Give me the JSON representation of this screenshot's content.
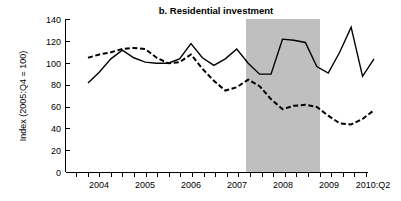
{
  "chart_data": {
    "type": "line",
    "title": "b. Residential investment",
    "xlabel": "",
    "ylabel": "Index (2005:Q4 = 100)",
    "ylim": [
      0,
      140
    ],
    "yticks": [
      0,
      20,
      40,
      60,
      80,
      100,
      120,
      140
    ],
    "ytick_labels": [
      "0",
      "20",
      "40",
      "60",
      "80",
      "100",
      "120",
      "140"
    ],
    "xlim": [
      "2004:Q1",
      "2010:Q2"
    ],
    "xtick_labels": [
      "2004",
      "2005",
      "2006",
      "2007",
      "2008",
      "2009",
      "2010:Q2"
    ],
    "grid": false,
    "legend": "none",
    "x": [
      "2004:Q1",
      "2004:Q2",
      "2004:Q3",
      "2004:Q4",
      "2005:Q1",
      "2005:Q2",
      "2005:Q3",
      "2005:Q4",
      "2006:Q1",
      "2006:Q2",
      "2006:Q3",
      "2006:Q4",
      "2007:Q1",
      "2007:Q2",
      "2007:Q3",
      "2007:Q4",
      "2008:Q1",
      "2008:Q2",
      "2008:Q3",
      "2008:Q4",
      "2009:Q1",
      "2009:Q2",
      "2009:Q3",
      "2009:Q4",
      "2010:Q1",
      "2010:Q2"
    ],
    "series": [
      {
        "name": "solid-series",
        "style": "solid",
        "color": "#000000",
        "values": [
          82,
          92,
          104,
          112,
          105,
          101,
          100,
          100,
          104,
          118,
          105,
          98,
          104,
          113,
          100,
          90,
          90,
          122,
          121,
          119,
          97,
          91,
          110,
          133,
          88,
          104
        ]
      },
      {
        "name": "dashed-series",
        "style": "dashed",
        "color": "#000000",
        "values": [
          105,
          108,
          110,
          113,
          114,
          113,
          105,
          100,
          101,
          108,
          95,
          84,
          75,
          78,
          85,
          79,
          67,
          58,
          61,
          62,
          60,
          52,
          45,
          44,
          49,
          57
        ]
      }
    ],
    "shaded_regions": [
      {
        "name": "recession-band",
        "label": "recession",
        "start": "2007:Q2",
        "end": "2009:Q1",
        "color": "#bfbfbf"
      }
    ]
  }
}
